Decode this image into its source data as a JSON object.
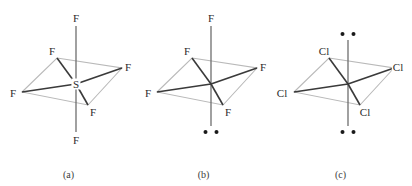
{
  "figure": {
    "type": "diagram",
    "panel_count": 3
  },
  "colors": {
    "bond_dark": "#3a3a3a",
    "bond_light": "#b9b9b9",
    "axis": "#6e6e6e",
    "label": "#2b2b2b",
    "dot": "#1a1a1a",
    "background": "#ffffff"
  },
  "panels": [
    {
      "id": "a",
      "caption": "(a)",
      "center_label": "S",
      "has_center_label": true,
      "lone_pairs": 0,
      "ligand_count": 6,
      "geometry": "octahedral",
      "ligands": [
        {
          "label": "F",
          "position": "axial-top",
          "x": 76,
          "y": 18
        },
        {
          "label": "F",
          "position": "equatorial-back-left",
          "x": 52,
          "y": 51
        },
        {
          "label": "F",
          "position": "equatorial-front-left",
          "x": 13,
          "y": 93
        },
        {
          "label": "F",
          "position": "equatorial-back-right",
          "x": 128,
          "y": 67
        },
        {
          "label": "F",
          "position": "equatorial-front-right",
          "x": 93,
          "y": 112
        },
        {
          "label": "F",
          "position": "axial-bottom",
          "x": 76,
          "y": 140
        }
      ]
    },
    {
      "id": "b",
      "caption": "(b)",
      "center_label": "",
      "has_center_label": false,
      "lone_pairs": 1,
      "ligand_count": 5,
      "geometry": "square pyramidal",
      "ligands": [
        {
          "label": "F",
          "position": "axial-top",
          "x": 76,
          "y": 18
        },
        {
          "label": "F",
          "position": "equatorial-back-left",
          "x": 52,
          "y": 51
        },
        {
          "label": "F",
          "position": "equatorial-front-left",
          "x": 13,
          "y": 93
        },
        {
          "label": "F",
          "position": "equatorial-back-right",
          "x": 128,
          "y": 67
        },
        {
          "label": "F",
          "position": "equatorial-front-right",
          "x": 93,
          "y": 112
        }
      ],
      "lone_pair_positions": [
        {
          "position": "bottom",
          "x": 76,
          "y": 131
        }
      ]
    },
    {
      "id": "c",
      "caption": "(c)",
      "center_label": "",
      "has_center_label": false,
      "lone_pairs": 2,
      "ligand_count": 4,
      "geometry": "square planar",
      "ligands": [
        {
          "label": "Cl",
          "position": "equatorial-back-left",
          "x": 52,
          "y": 51
        },
        {
          "label": "Cl",
          "position": "equatorial-front-left",
          "x": 10,
          "y": 93
        },
        {
          "label": "Cl",
          "position": "equatorial-back-right",
          "x": 126,
          "y": 67
        },
        {
          "label": "Cl",
          "position": "equatorial-front-right",
          "x": 93,
          "y": 112
        }
      ],
      "lone_pair_positions": [
        {
          "position": "top",
          "x": 76,
          "y": 33
        },
        {
          "position": "bottom",
          "x": 76,
          "y": 131
        }
      ]
    }
  ],
  "geometry_coords": {
    "center": {
      "x": 76,
      "y": 84
    },
    "axis_top": {
      "x": 76,
      "y": 26
    },
    "axis_bottom": {
      "x": 76,
      "y": 132
    },
    "vertex_back_left": {
      "x": 57,
      "y": 58
    },
    "vertex_front_left": {
      "x": 22,
      "y": 92
    },
    "vertex_back_right": {
      "x": 122,
      "y": 68
    },
    "vertex_front_right": {
      "x": 88,
      "y": 105
    }
  }
}
